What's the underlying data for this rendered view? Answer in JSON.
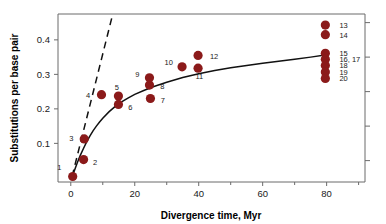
{
  "chart_data": {
    "type": "scatter",
    "title": "",
    "xlabel": "Divergence time, Myr",
    "ylabel": "Substitutions per base pair",
    "xlim": [
      -4,
      92
    ],
    "ylim": [
      -0.012,
      0.475
    ],
    "xticks": [
      0,
      20,
      40,
      60,
      80
    ],
    "xticklabels": [
      "0",
      "20",
      "40",
      "60",
      "80"
    ],
    "xminorticks": [
      10,
      30,
      50,
      70,
      90
    ],
    "yticks": [
      0.1,
      0.2,
      0.3,
      0.4
    ],
    "yticklabels": [
      "0.1",
      "0.2",
      "0.3",
      "0.4"
    ],
    "yminorticks": [
      0.05,
      0.15,
      0.25,
      0.35,
      0.45
    ],
    "grid": false,
    "legend": false,
    "marker_color": "#8B1A1A",
    "marker_size": 4.6,
    "curve_color": "#111111",
    "frame_color": "#6b6b6b",
    "points": [
      {
        "label": "1",
        "x": 0.6,
        "y": 0.004,
        "lx": -3.6,
        "ly": 0.03,
        "anchor": "middle"
      },
      {
        "label": "2",
        "x": 4.0,
        "y": 0.053,
        "lx": 7.6,
        "ly": 0.046,
        "anchor": "middle"
      },
      {
        "label": "3",
        "x": 4.2,
        "y": 0.113,
        "lx": 0.2,
        "ly": 0.114,
        "anchor": "middle"
      },
      {
        "label": "4",
        "x": 9.6,
        "y": 0.241,
        "lx": 5.4,
        "ly": 0.239,
        "anchor": "middle"
      },
      {
        "label": "5",
        "x": 14.9,
        "y": 0.237,
        "lx": 14.4,
        "ly": 0.261,
        "anchor": "middle"
      },
      {
        "label": "6",
        "x": 14.9,
        "y": 0.213,
        "lx": 18.6,
        "ly": 0.203,
        "anchor": "middle"
      },
      {
        "label": "7",
        "x": 24.9,
        "y": 0.23,
        "lx": 28.8,
        "ly": 0.226,
        "anchor": "middle"
      },
      {
        "label": "8",
        "x": 24.6,
        "y": 0.269,
        "lx": 28.6,
        "ly": 0.266,
        "anchor": "middle"
      },
      {
        "label": "9",
        "x": 24.6,
        "y": 0.29,
        "lx": 20.8,
        "ly": 0.3,
        "anchor": "middle"
      },
      {
        "label": "10",
        "x": 34.8,
        "y": 0.322,
        "lx": 30.6,
        "ly": 0.334,
        "anchor": "middle"
      },
      {
        "label": "11",
        "x": 39.8,
        "y": 0.318,
        "lx": 40.2,
        "ly": 0.295,
        "anchor": "middle"
      },
      {
        "label": "12",
        "x": 39.8,
        "y": 0.355,
        "lx": 44.8,
        "ly": 0.353,
        "anchor": "middle"
      },
      {
        "label": "13",
        "x": 79.6,
        "y": 0.443,
        "lx": 84.0,
        "ly": 0.441,
        "anchor": "start"
      },
      {
        "label": "14",
        "x": 79.6,
        "y": 0.415,
        "lx": 84.0,
        "ly": 0.413,
        "anchor": "start"
      },
      {
        "label": "15",
        "x": 79.6,
        "y": 0.361,
        "lx": 84.0,
        "ly": 0.362,
        "anchor": "start"
      },
      {
        "label": "16, 17",
        "x": 79.6,
        "y": 0.344,
        "lx": 84.0,
        "ly": 0.344,
        "anchor": "start"
      },
      {
        "label": "18",
        "x": 79.6,
        "y": 0.326,
        "lx": 84.0,
        "ly": 0.325,
        "anchor": "start"
      },
      {
        "label": "19",
        "x": 79.6,
        "y": 0.307,
        "lx": 84.0,
        "ly": 0.306,
        "anchor": "start"
      },
      {
        "label": "20",
        "x": 79.6,
        "y": 0.288,
        "lx": 84.0,
        "ly": 0.287,
        "anchor": "start"
      }
    ],
    "fit_curve": {
      "name": "saturating fit",
      "style": "solid",
      "x": [
        0.4,
        1,
        2,
        3,
        4,
        5,
        6,
        7,
        8,
        9,
        10,
        12,
        14,
        16,
        18,
        20,
        23,
        26,
        30,
        35,
        40,
        45,
        50,
        55,
        60,
        65,
        70,
        75,
        80
      ],
      "y": [
        0.004,
        0.018,
        0.043,
        0.066,
        0.086,
        0.105,
        0.122,
        0.137,
        0.15,
        0.162,
        0.173,
        0.192,
        0.208,
        0.221,
        0.232,
        0.242,
        0.254,
        0.265,
        0.277,
        0.291,
        0.302,
        0.311,
        0.319,
        0.326,
        0.332,
        0.338,
        0.344,
        0.35,
        0.357
      ]
    },
    "dashed_line": {
      "name": "linear extrapolation from origin",
      "style": "dashed",
      "x": [
        0.4,
        13.1
      ],
      "y": [
        0.004,
        0.474
      ]
    }
  }
}
